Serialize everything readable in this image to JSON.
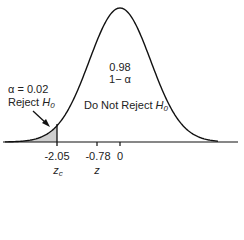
{
  "center_label": {
    "value": "0.98",
    "expr": "1− α"
  },
  "reject_label": {
    "alpha": "α = 0.02",
    "reject": "Reject",
    "h": "H",
    "h_sub": "0"
  },
  "accept_label": {
    "text": "Do Not Reject",
    "h": "H",
    "h_sub": "0"
  },
  "ticks": [
    {
      "label": "-2.05",
      "var": "z",
      "var_sub": "c"
    },
    {
      "label": "-0.78",
      "var": "z",
      "var_sub": ""
    },
    {
      "label": "0"
    }
  ],
  "chart_data": {
    "type": "area",
    "title": "",
    "alpha": 0.02,
    "confidence": 0.98,
    "critical_value": -2.05,
    "test_statistic": -0.78,
    "mean": 0,
    "regions": [
      {
        "name": "Reject H0",
        "from": "-inf",
        "to": -2.05,
        "area": 0.02
      },
      {
        "name": "Do Not Reject H0",
        "from": -2.05,
        "to": "inf",
        "area": 0.98
      }
    ],
    "xlabel": "z",
    "ylabel": ""
  }
}
